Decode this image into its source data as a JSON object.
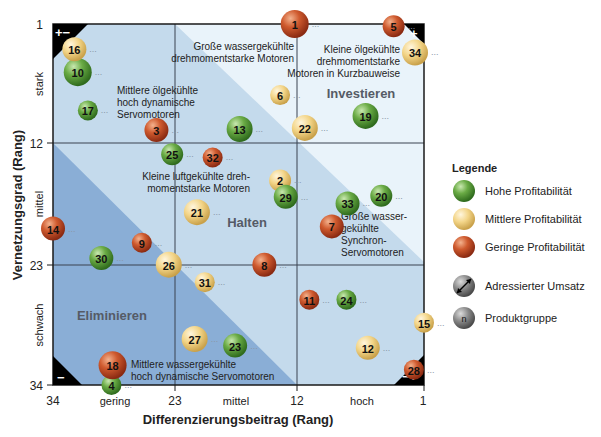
{
  "chart_data": {
    "type": "scatter",
    "subtype": "bubble-portfolio-matrix",
    "xlabel": "Differenzierungsbeitrag (Rang)",
    "ylabel": "Vernetzungsgrad (Rang)",
    "x_ticks": [
      "34",
      "23",
      "12",
      "1"
    ],
    "y_ticks": [
      "1",
      "12",
      "23",
      "34"
    ],
    "x_categories": [
      "gering",
      "mittel",
      "hoch"
    ],
    "y_categories": [
      "stark",
      "mittel",
      "schwach"
    ],
    "xlim": [
      34,
      1
    ],
    "ylim": [
      34,
      1
    ],
    "grid": true,
    "zones": [
      "Investieren",
      "Halten",
      "Eliminieren"
    ],
    "corner_markers": {
      "top_left": "+−",
      "top_right": "+",
      "bottom_left": "−",
      "bottom_right": "−+"
    },
    "annotations": [
      {
        "text": [
          "Große wassergekühlte",
          "drehmomentstarke Motoren"
        ]
      },
      {
        "text": [
          "Kleine ölgekühlte",
          "drehmomentstarke",
          "Motoren in Kurzbauweise"
        ]
      },
      {
        "text": [
          "Mittlere ölgekühlte",
          "hoch dynamische",
          "Servomotoren"
        ]
      },
      {
        "text": [
          "Kleine luftgekühlte dreh-",
          "momentstarke Motoren"
        ]
      },
      {
        "text": [
          "Große wasser-",
          "gekühlte",
          "Synchron-",
          "Servomotoren"
        ]
      },
      {
        "text": [
          "Mittlere wassergekühlte",
          "hoch dynamische Servomotoren"
        ]
      }
    ],
    "legend": {
      "title": "Legende",
      "position": "right",
      "entries": [
        {
          "label": "Hohe Profitabilität",
          "color": "#5a9a3c"
        },
        {
          "label": "Mittlere Profitabilität",
          "color": "#f0cf7a"
        },
        {
          "label": "Geringe Profitabilität",
          "color": "#c9522a"
        },
        {
          "label": "Adressierter Umsatz",
          "color": "#777777",
          "symbol": "size"
        },
        {
          "label": "Produktgruppe",
          "color": "#777777",
          "symbol": "n"
        }
      ]
    },
    "points": [
      {
        "id": 1,
        "x": 12.5,
        "y": 1,
        "profit": "low",
        "size": 14
      },
      {
        "id": 2,
        "x": 13.8,
        "y": 15.3,
        "profit": "medium",
        "size": 11
      },
      {
        "id": 3,
        "x": 24.8,
        "y": 10.7,
        "profit": "low",
        "size": 12
      },
      {
        "id": 4,
        "x": 28.8,
        "y": 34,
        "profit": "high",
        "size": 10
      },
      {
        "id": 5,
        "x": 3.7,
        "y": 1.2,
        "profit": "low",
        "size": 11
      },
      {
        "id": 6,
        "x": 13.8,
        "y": 7.5,
        "profit": "medium",
        "size": 10
      },
      {
        "id": 7,
        "x": 9.2,
        "y": 19.5,
        "profit": "low",
        "size": 12
      },
      {
        "id": 8,
        "x": 15.2,
        "y": 23,
        "profit": "low",
        "size": 12
      },
      {
        "id": 9,
        "x": 26.1,
        "y": 21,
        "profit": "low",
        "size": 10
      },
      {
        "id": 10,
        "x": 31.8,
        "y": 5.4,
        "profit": "high",
        "size": 14
      },
      {
        "id": 11,
        "x": 11.2,
        "y": 26.2,
        "profit": "low",
        "size": 10
      },
      {
        "id": 12,
        "x": 6,
        "y": 30.6,
        "profit": "medium",
        "size": 12
      },
      {
        "id": 13,
        "x": 17.4,
        "y": 10.6,
        "profit": "high",
        "size": 13
      },
      {
        "id": 14,
        "x": 34,
        "y": 19.7,
        "profit": "low",
        "size": 12
      },
      {
        "id": 15,
        "x": 1,
        "y": 28.3,
        "profit": "medium",
        "size": 10
      },
      {
        "id": 16,
        "x": 32.1,
        "y": 3.3,
        "profit": "medium",
        "size": 12
      },
      {
        "id": 17,
        "x": 30.9,
        "y": 8.9,
        "profit": "high",
        "size": 10
      },
      {
        "id": 18,
        "x": 28.7,
        "y": 32.2,
        "profit": "low",
        "size": 14
      },
      {
        "id": 19,
        "x": 6.2,
        "y": 9.4,
        "profit": "high",
        "size": 13
      },
      {
        "id": 20,
        "x": 4.8,
        "y": 16.7,
        "profit": "high",
        "size": 11
      },
      {
        "id": 21,
        "x": 21.2,
        "y": 18.2,
        "profit": "medium",
        "size": 13
      },
      {
        "id": 22,
        "x": 11.6,
        "y": 10.5,
        "profit": "medium",
        "size": 13
      },
      {
        "id": 23,
        "x": 17.8,
        "y": 30.4,
        "profit": "high",
        "size": 12
      },
      {
        "id": 24,
        "x": 7.9,
        "y": 26.2,
        "profit": "high",
        "size": 10
      },
      {
        "id": 25,
        "x": 23.4,
        "y": 12.9,
        "profit": "high",
        "size": 11
      },
      {
        "id": 26,
        "x": 23.7,
        "y": 23,
        "profit": "medium",
        "size": 13
      },
      {
        "id": 27,
        "x": 21.4,
        "y": 29.8,
        "profit": "medium",
        "size": 13
      },
      {
        "id": 28,
        "x": 1.9,
        "y": 32.6,
        "profit": "low",
        "size": 10
      },
      {
        "id": 29,
        "x": 13.3,
        "y": 16.8,
        "profit": "high",
        "size": 12
      },
      {
        "id": 30,
        "x": 29.7,
        "y": 22.4,
        "profit": "high",
        "size": 12
      },
      {
        "id": 31,
        "x": 20.5,
        "y": 24.6,
        "profit": "medium",
        "size": 10
      },
      {
        "id": 32,
        "x": 19.8,
        "y": 13.2,
        "profit": "low",
        "size": 10
      },
      {
        "id": 33,
        "x": 7.8,
        "y": 17.4,
        "profit": "high",
        "size": 12
      },
      {
        "id": 34,
        "x": 1.8,
        "y": 3.6,
        "profit": "medium",
        "size": 13
      }
    ]
  },
  "labels": {
    "x_ticks": [
      "34",
      "23",
      "12",
      "1"
    ],
    "y_ticks": [
      "1",
      "12",
      "23",
      "34"
    ],
    "x_cats": [
      "gering",
      "mittel",
      "hoch"
    ],
    "y_cats": [
      "stark",
      "mittel",
      "schwach"
    ],
    "xlabel": "Differenzierungsbeitrag (Rang)",
    "ylabel": "Vernetzungsgrad (Rang)",
    "zone_invest": "Investieren",
    "zone_hold": "Halten",
    "zone_elim": "Eliminieren",
    "annot1": [
      "Große wassergekühlte",
      "drehmomentstarke Motoren"
    ],
    "annot2": [
      "Kleine ölgekühlte",
      "drehmomentstarke",
      "Motoren in Kurzbauweise"
    ],
    "annot3": [
      "Mittlere ölgekühlte",
      "hoch dynamische",
      "Servomotoren"
    ],
    "annot4": [
      "Kleine luftgekühlte dreh-",
      "momentstarke Motoren"
    ],
    "annot5": [
      "Große wasser-",
      "gekühlte",
      "Synchron-",
      "Servomotoren"
    ],
    "annot6": [
      "Mittlere wassergekühlte",
      "hoch dynamische Servomotoren"
    ],
    "corner_tl": "+−",
    "corner_tr": "+",
    "corner_bl": "−",
    "corner_br": "−+",
    "legend_title": "Legende",
    "legend": [
      "Hohe Profitabilität",
      "Mittlere Profitabilität",
      "Geringe Profitabilität",
      "Adressierter Umsatz",
      "Produktgruppe"
    ],
    "legend_n": "n",
    "dots": "..."
  },
  "colors": {
    "high": "#5a9a3c",
    "medium": "#f0cf7a",
    "low": "#c9522a",
    "neutral": "#777777",
    "bg_light": "#e9f3fa",
    "bg_mid": "#c4daec",
    "bg_dark": "#8aaed6"
  }
}
